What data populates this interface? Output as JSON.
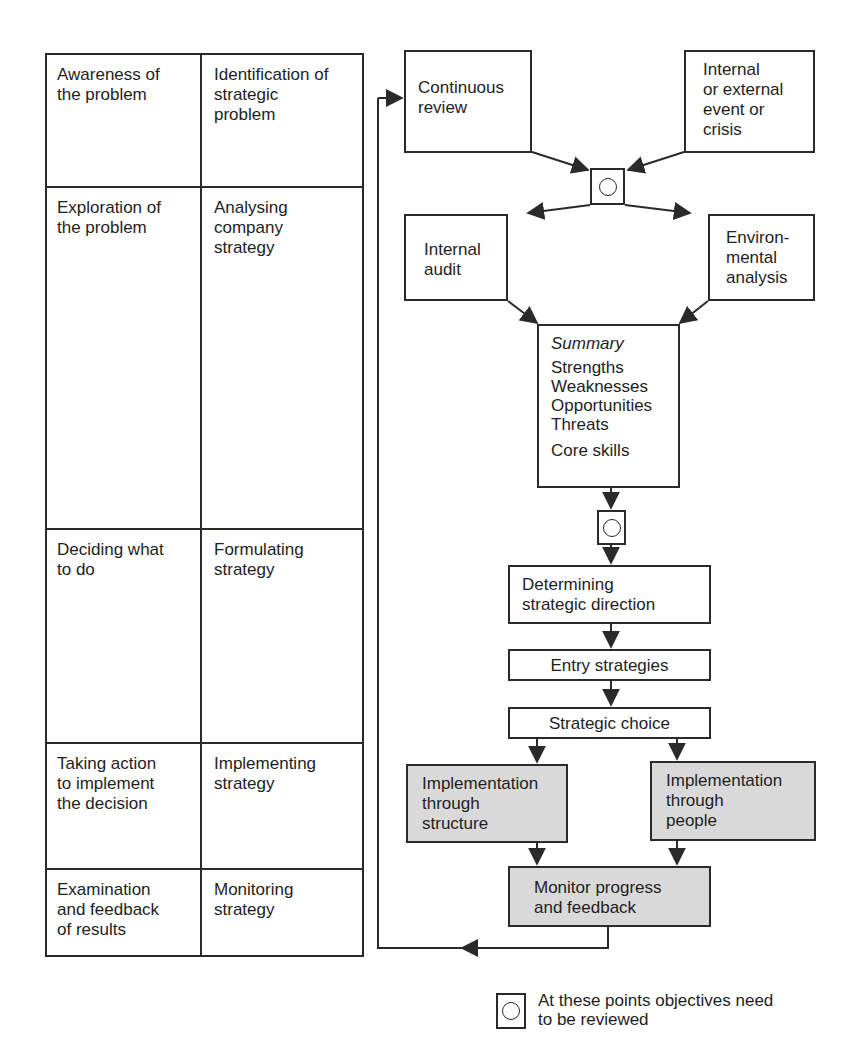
{
  "phases": {
    "rows": [
      {
        "stage": "Awareness of\nthe problem",
        "activity": "Identification of\nstrategic\nproblem"
      },
      {
        "stage": "Exploration of\nthe problem",
        "activity": "Analysing\ncompany\nstrategy"
      },
      {
        "stage": "Deciding what\nto do",
        "activity": "Formulating\nstrategy"
      },
      {
        "stage": "Taking action\nto implement\nthe decision",
        "activity": "Implementing\nstrategy"
      },
      {
        "stage": "Examination\nand feedback\nof results",
        "activity": "Monitoring\nstrategy"
      }
    ]
  },
  "flowchart": {
    "continuous_review": "Continuous\nreview",
    "external_event": "Internal\nor external\nevent or\ncrisis",
    "internal_audit": "Internal\naudit",
    "environmental_analysis": "Environ-\nmental\nanalysis",
    "summary": {
      "heading": "Summary",
      "swot": "Strengths\nWeaknesses\nOpportunities\nThreats",
      "core": "Core skills"
    },
    "strategic_direction": "Determining\nstrategic direction",
    "entry_strategies": "Entry strategies",
    "strategic_choice": "Strategic choice",
    "impl_structure": "Implementation\nthrough\nstructure",
    "impl_people": "Implementation\nthrough\npeople",
    "monitor": "Monitor progress\nand feedback"
  },
  "legend": {
    "icon": "review-point-icon",
    "text": "At these points objectives need\nto be reviewed"
  },
  "colors": {
    "line": "#2a2a2a",
    "shaded_fill": "#d9d9d9",
    "background": "#ffffff"
  }
}
